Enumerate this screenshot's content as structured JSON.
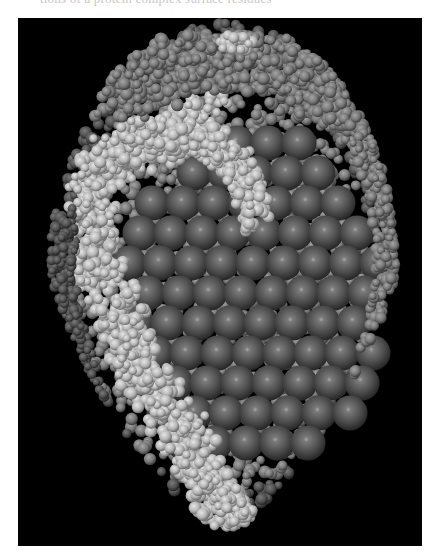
{
  "page": {
    "background": "#ffffff",
    "cut_off_caption": "tions of a protein complex surface residues"
  },
  "figure": {
    "background": "#000000",
    "colors": {
      "large_core_spheres": "#5a5a5a",
      "core_highlight": "#9a9a9a",
      "light_chain_atoms": "#bdbdbd",
      "medium_chain_atoms": "#7c7c7c"
    },
    "frame": {
      "left": 18,
      "top": 18,
      "width": 404,
      "height": 528
    }
  }
}
